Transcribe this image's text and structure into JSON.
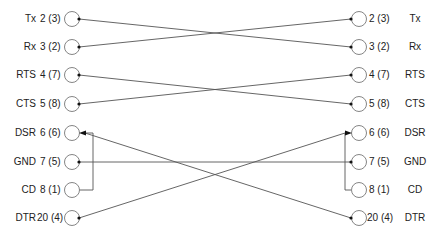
{
  "diagram": {
    "type": "serial cable pinout wiring",
    "left": [
      {
        "name": "Tx",
        "pin": "2 (3)",
        "y": 19
      },
      {
        "name": "Rx",
        "pin": "3 (2)",
        "y": 47
      },
      {
        "name": "RTS",
        "pin": "4 (7)",
        "y": 75
      },
      {
        "name": "CTS",
        "pin": "5 (8)",
        "y": 104
      },
      {
        "name": "DSR",
        "pin": "6 (6)",
        "y": 133
      },
      {
        "name": "GND",
        "pin": "7 (5)",
        "y": 162
      },
      {
        "name": "CD",
        "pin": "8 (1)",
        "y": 190
      },
      {
        "name": "DTR",
        "pin": "20 (4)",
        "y": 218
      }
    ],
    "right": [
      {
        "name": "Tx",
        "pin": "2 (3)",
        "y": 19
      },
      {
        "name": "Rx",
        "pin": "3 (2)",
        "y": 47
      },
      {
        "name": "RTS",
        "pin": "4 (7)",
        "y": 75
      },
      {
        "name": "CTS",
        "pin": "5 (8)",
        "y": 104
      },
      {
        "name": "DSR",
        "pin": "6 (6)",
        "y": 133
      },
      {
        "name": "GND",
        "pin": "7 (5)",
        "y": 162
      },
      {
        "name": "CD",
        "pin": "8 (1)",
        "y": 190
      },
      {
        "name": "DTR",
        "pin": "20 (4)",
        "y": 218
      }
    ],
    "connections": [
      {
        "from": "left.Tx",
        "to": "right.Rx"
      },
      {
        "from": "left.Rx",
        "to": "right.Tx"
      },
      {
        "from": "left.RTS",
        "to": "right.CTS"
      },
      {
        "from": "left.CTS",
        "to": "right.RTS"
      },
      {
        "from": "left.DSR",
        "to": "right.DTR"
      },
      {
        "from": "left.GND",
        "to": "right.GND"
      },
      {
        "from": "left.CD",
        "to": "left.DSR",
        "note": "jumper"
      },
      {
        "from": "left.DTR",
        "to": "right.DSR"
      },
      {
        "from": "right.CD",
        "to": "right.DSR",
        "note": "jumper"
      }
    ],
    "colors": {
      "line": "#555555",
      "circle": "#777777",
      "text": "#222222"
    }
  }
}
